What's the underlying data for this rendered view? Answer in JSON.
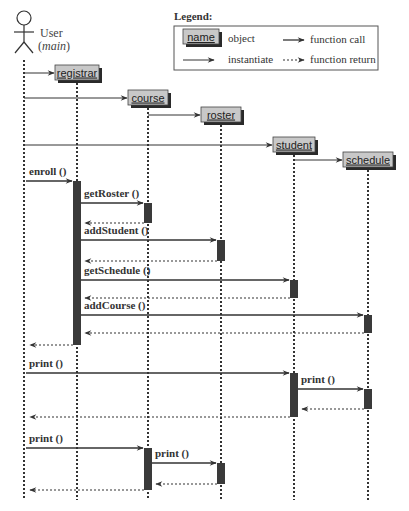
{
  "actor": {
    "name": "User",
    "subtitle": "main"
  },
  "legend": {
    "title": "Legend:",
    "object_sample": "name",
    "object_label": "object",
    "instantiate_label": "instantiate",
    "call_label": "function call",
    "return_label": "function return"
  },
  "objects": [
    {
      "id": "registrar",
      "label": "registrar"
    },
    {
      "id": "course",
      "label": "course"
    },
    {
      "id": "roster",
      "label": "roster"
    },
    {
      "id": "student",
      "label": "student"
    },
    {
      "id": "schedule",
      "label": "schedule"
    }
  ],
  "instantiations": [
    {
      "from": "user",
      "to": "registrar"
    },
    {
      "from": "user",
      "to": "course"
    },
    {
      "from": "course",
      "to": "roster"
    },
    {
      "from": "user",
      "to": "student"
    },
    {
      "from": "student",
      "to": "schedule"
    }
  ],
  "messages": [
    {
      "from": "user",
      "to": "registrar",
      "label": "enroll ()",
      "type": "call"
    },
    {
      "from": "registrar",
      "to": "course",
      "label": "getRoster ()",
      "type": "call"
    },
    {
      "from": "course",
      "to": "registrar",
      "label": "",
      "type": "return"
    },
    {
      "from": "registrar",
      "to": "roster",
      "label": "addStudent ()",
      "type": "call"
    },
    {
      "from": "roster",
      "to": "registrar",
      "label": "",
      "type": "return"
    },
    {
      "from": "registrar",
      "to": "student",
      "label": "getSchedule ()",
      "type": "call"
    },
    {
      "from": "student",
      "to": "registrar",
      "label": "",
      "type": "return"
    },
    {
      "from": "registrar",
      "to": "schedule",
      "label": "addCourse ()",
      "type": "call"
    },
    {
      "from": "schedule",
      "to": "registrar",
      "label": "",
      "type": "return"
    },
    {
      "from": "registrar",
      "to": "user",
      "label": "",
      "type": "return"
    },
    {
      "from": "user",
      "to": "student",
      "label": "print ()",
      "type": "call"
    },
    {
      "from": "student",
      "to": "schedule",
      "label": "print ()",
      "type": "call"
    },
    {
      "from": "schedule",
      "to": "student",
      "label": "",
      "type": "return"
    },
    {
      "from": "student",
      "to": "user",
      "label": "",
      "type": "return"
    },
    {
      "from": "user",
      "to": "course",
      "label": "print ()",
      "type": "call"
    },
    {
      "from": "course",
      "to": "roster",
      "label": "print ()",
      "type": "call"
    },
    {
      "from": "roster",
      "to": "course",
      "label": "",
      "type": "return"
    },
    {
      "from": "course",
      "to": "user",
      "label": "",
      "type": "return"
    }
  ],
  "colors": {
    "object_fill": "#c8c8c8",
    "object_shadow": "#2a2a2a",
    "activation": "#3a3a3a",
    "line": "#333333"
  }
}
